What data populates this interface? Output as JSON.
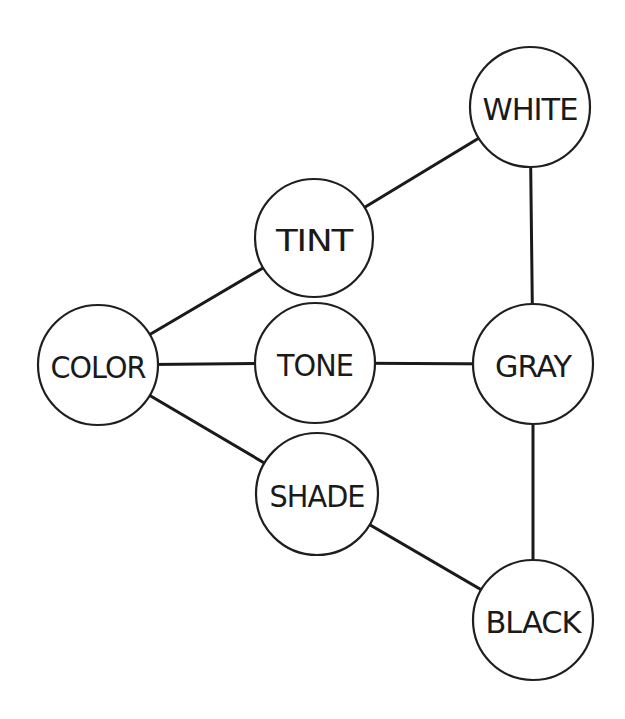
{
  "diagram": {
    "type": "network",
    "nodes": [
      {
        "id": "color",
        "label": "COLOR",
        "cx": 98,
        "cy": 365,
        "r": 60
      },
      {
        "id": "tint",
        "label": "TINT",
        "cx": 314,
        "cy": 238,
        "r": 59
      },
      {
        "id": "tone",
        "label": "TONE",
        "cx": 315,
        "cy": 363,
        "r": 60
      },
      {
        "id": "shade",
        "label": "SHADE",
        "cx": 317,
        "cy": 494,
        "r": 61
      },
      {
        "id": "white",
        "label": "WHITE",
        "cx": 530,
        "cy": 107,
        "r": 60
      },
      {
        "id": "gray",
        "label": "GRAY",
        "cx": 533,
        "cy": 364,
        "r": 60
      },
      {
        "id": "black",
        "label": "BLACK",
        "cx": 533,
        "cy": 620,
        "r": 60
      }
    ],
    "edges": [
      {
        "from": "color",
        "to": "tint"
      },
      {
        "from": "color",
        "to": "tone"
      },
      {
        "from": "color",
        "to": "shade"
      },
      {
        "from": "tint",
        "to": "white"
      },
      {
        "from": "tone",
        "to": "gray"
      },
      {
        "from": "shade",
        "to": "black"
      },
      {
        "from": "white",
        "to": "gray"
      },
      {
        "from": "gray",
        "to": "black"
      }
    ],
    "colors": {
      "stroke": "#1a1a1a",
      "fill": "#ffffff",
      "background": "#ffffff"
    }
  }
}
